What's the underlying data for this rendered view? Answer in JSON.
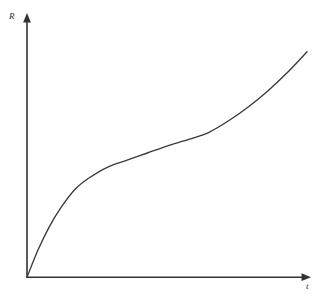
{
  "figure": {
    "background_color": "#ffffff",
    "line_color": "#3a3a3a",
    "axis_color": "#333333",
    "label_color": "#2b2b2b",
    "caption_sliver": ""
  },
  "chart_data": {
    "type": "line",
    "title": "",
    "subtitle": "",
    "xlabel": "t",
    "ylabel": "R",
    "grid": false,
    "legend": null,
    "axis_style": "arrowed-half-axes",
    "tick_labels": {
      "x": [],
      "y": []
    },
    "xlim": [
      0,
      1
    ],
    "ylim": [
      0,
      1
    ],
    "annotations": [],
    "series": [
      {
        "name": "R(t)",
        "shape": "sigmoid-with-steep-initial-rise",
        "x": [
          0.0,
          0.04,
          0.08,
          0.12,
          0.17,
          0.22,
          0.29,
          0.36,
          0.43,
          0.5,
          0.58,
          0.65,
          0.72,
          0.79,
          0.86,
          0.93,
          1.0
        ],
        "y": [
          0.0,
          0.12,
          0.22,
          0.3,
          0.38,
          0.43,
          0.48,
          0.51,
          0.54,
          0.57,
          0.6,
          0.63,
          0.68,
          0.74,
          0.81,
          0.89,
          0.98
        ]
      }
    ]
  }
}
